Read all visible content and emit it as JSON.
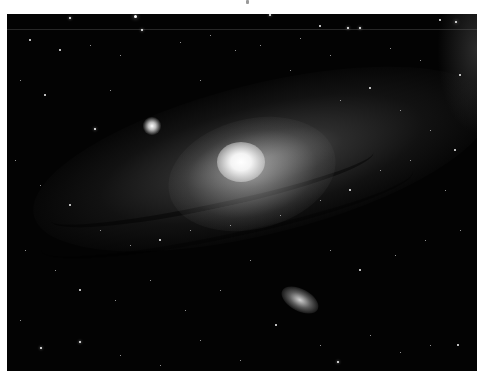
{
  "image": {
    "subject": "Spiral galaxy (Andromeda-like) with two companion galaxies in a starfield",
    "palette": {
      "background": "#ffffff",
      "sky": "#030303",
      "core": "#ffffff",
      "disk": "#8a8a8a"
    },
    "frame": {
      "left": 7,
      "top": 14,
      "width": 470,
      "height": 357
    },
    "features": [
      {
        "name": "galaxy-core",
        "x": 240,
        "y": 160
      },
      {
        "name": "companion-galaxy-upper",
        "x": 152,
        "y": 128
      },
      {
        "name": "companion-galaxy-lower",
        "x": 298,
        "y": 300
      }
    ],
    "stars": [
      [
        70,
        18,
        2
      ],
      [
        135,
        16,
        3
      ],
      [
        142,
        30,
        2
      ],
      [
        270,
        15,
        2
      ],
      [
        305,
        6,
        1.5
      ],
      [
        320,
        26,
        1.5
      ],
      [
        348,
        28,
        2
      ],
      [
        360,
        28,
        2
      ],
      [
        456,
        22,
        2.5
      ],
      [
        440,
        20,
        1.5
      ],
      [
        30,
        40,
        1.5
      ],
      [
        60,
        50,
        1.5
      ],
      [
        90,
        45,
        1
      ],
      [
        120,
        55,
        1
      ],
      [
        180,
        42,
        1
      ],
      [
        210,
        35,
        1
      ],
      [
        235,
        50,
        1
      ],
      [
        260,
        45,
        1
      ],
      [
        300,
        38,
        1
      ],
      [
        330,
        55,
        1
      ],
      [
        390,
        48,
        1
      ],
      [
        420,
        60,
        1
      ],
      [
        460,
        75,
        1.5
      ],
      [
        20,
        80,
        1
      ],
      [
        45,
        95,
        1.5
      ],
      [
        95,
        129,
        2
      ],
      [
        110,
        90,
        1
      ],
      [
        200,
        80,
        1
      ],
      [
        290,
        70,
        1
      ],
      [
        340,
        100,
        1
      ],
      [
        370,
        88,
        1.5
      ],
      [
        400,
        110,
        1
      ],
      [
        430,
        130,
        1
      ],
      [
        455,
        150,
        1.5
      ],
      [
        15,
        160,
        1
      ],
      [
        40,
        185,
        1
      ],
      [
        70,
        205,
        1.5
      ],
      [
        100,
        230,
        1
      ],
      [
        130,
        245,
        1
      ],
      [
        160,
        240,
        1.5
      ],
      [
        190,
        230,
        1
      ],
      [
        230,
        225,
        1
      ],
      [
        280,
        215,
        1
      ],
      [
        320,
        200,
        1
      ],
      [
        350,
        190,
        1.5
      ],
      [
        380,
        170,
        1
      ],
      [
        410,
        160,
        1
      ],
      [
        445,
        190,
        1
      ],
      [
        25,
        250,
        1
      ],
      [
        55,
        270,
        1
      ],
      [
        80,
        290,
        1.5
      ],
      [
        115,
        300,
        1
      ],
      [
        150,
        280,
        1
      ],
      [
        185,
        310,
        1
      ],
      [
        220,
        290,
        1
      ],
      [
        250,
        260,
        1
      ],
      [
        330,
        250,
        1
      ],
      [
        360,
        270,
        1.5
      ],
      [
        395,
        255,
        1
      ],
      [
        425,
        240,
        1
      ],
      [
        460,
        230,
        1
      ],
      [
        20,
        320,
        1
      ],
      [
        41,
        348,
        2
      ],
      [
        80,
        342,
        2
      ],
      [
        120,
        355,
        1
      ],
      [
        160,
        365,
        1
      ],
      [
        200,
        340,
        1
      ],
      [
        240,
        360,
        1
      ],
      [
        276,
        325,
        1.5
      ],
      [
        320,
        345,
        1
      ],
      [
        338,
        362,
        2
      ],
      [
        370,
        335,
        1
      ],
      [
        400,
        352,
        1
      ],
      [
        430,
        345,
        1
      ],
      [
        458,
        345,
        1.5
      ]
    ]
  }
}
